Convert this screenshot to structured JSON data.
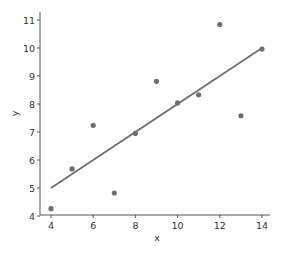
{
  "chart_data": {
    "type": "scatter",
    "title": "",
    "xlabel": "x",
    "ylabel": "y",
    "xlim": [
      3.6,
      14.4
    ],
    "ylim": [
      3.95,
      11.2
    ],
    "xticks": [
      4,
      6,
      8,
      10,
      12,
      14
    ],
    "yticks": [
      4,
      5,
      6,
      7,
      8,
      9,
      10,
      11
    ],
    "grid": false,
    "legend": "none",
    "series": [
      {
        "name": "points",
        "x": [
          10,
          8,
          13,
          9,
          11,
          14,
          6,
          4,
          12,
          7,
          5
        ],
        "y": [
          8.04,
          6.95,
          7.58,
          8.81,
          8.33,
          9.96,
          7.24,
          4.26,
          10.84,
          4.82,
          5.68
        ]
      }
    ],
    "fit_line": {
      "name": "linear fit",
      "x": [
        4,
        14
      ],
      "y": [
        5.0,
        10.0
      ]
    }
  }
}
